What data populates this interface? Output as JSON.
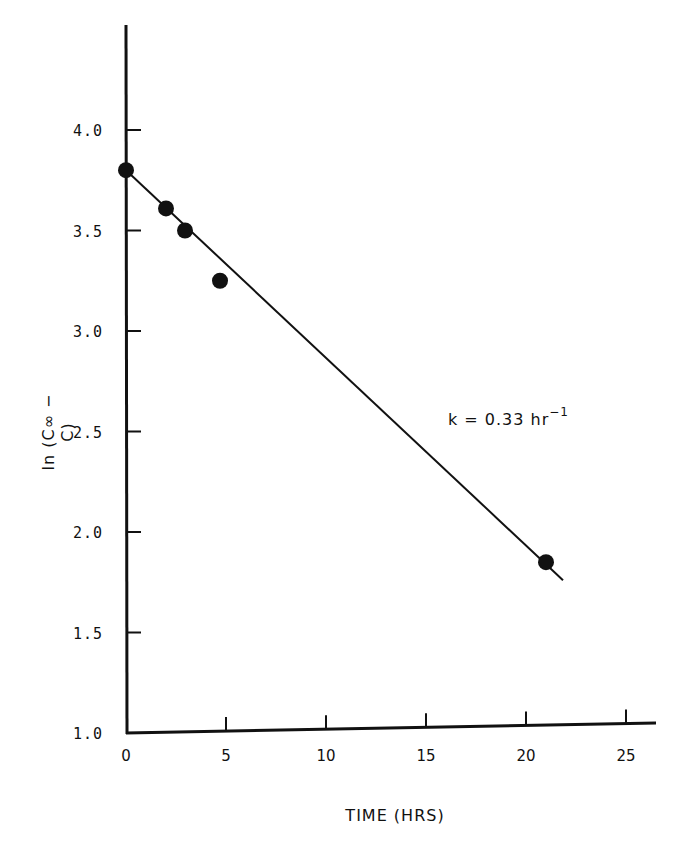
{
  "chart_data": {
    "type": "scatter",
    "title": "",
    "xlabel": "TIME (HRS)",
    "ylabel": "ln (C∞ − C)",
    "ylabel_parts": {
      "prefix": "ln (C",
      "subscript": "∞",
      "suffix": " − C)"
    },
    "xlim": [
      0,
      26
    ],
    "ylim": [
      1.0,
      4.5
    ],
    "x_ticks": [
      0,
      5,
      10,
      15,
      20,
      25
    ],
    "x_tick_labels": [
      "0",
      "5",
      "10",
      "15",
      "20",
      "25"
    ],
    "y_ticks": [
      1.0,
      1.5,
      2.0,
      2.5,
      3.0,
      3.5,
      4.0
    ],
    "y_tick_labels": [
      "1.0",
      "1.5",
      "2.0",
      "2.5",
      "3.0",
      "3.5",
      "4.0"
    ],
    "grid": false,
    "legend": null,
    "series": [
      {
        "name": "observed",
        "marker": "filled-circle",
        "points": [
          {
            "x": 0.0,
            "y": 3.8
          },
          {
            "x": 2.0,
            "y": 3.61
          },
          {
            "x": 2.95,
            "y": 3.5
          },
          {
            "x": 4.7,
            "y": 3.25
          },
          {
            "x": 21.0,
            "y": 1.85
          }
        ]
      },
      {
        "name": "fit",
        "type": "line",
        "points": [
          {
            "x": 0.0,
            "y": 3.8
          },
          {
            "x": 21.85,
            "y": 1.76
          }
        ]
      }
    ],
    "annotations": [
      {
        "text": "k = 0.33 hr⁻¹",
        "x": 16.2,
        "y": 2.58
      }
    ]
  },
  "labels": {
    "xlabel": "TIME (HRS)",
    "ylabel": "ln (C∞ − C)",
    "annotation_main": "k = 0.33 hr",
    "annotation_sup": "−1"
  },
  "colors": {
    "ink": "#111111",
    "background": "#ffffff"
  }
}
